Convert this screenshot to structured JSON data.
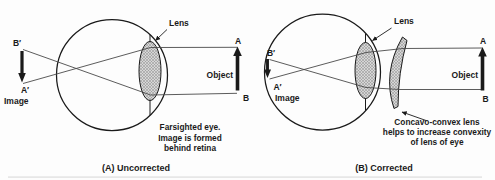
{
  "figure": {
    "title_semantic": "Farsighted eye correction diagram",
    "colors": {
      "ink": "#1a1a1a",
      "ray": "#4a4a4a",
      "lens_fill": "#d6d6d6",
      "lens_hatch": "#8e8e8e",
      "bg": "#fdfdfd",
      "artifact": "#dcdcdc"
    }
  },
  "panel_a": {
    "caption": "(A) Uncorrected",
    "lens_label": "Lens",
    "object_label": "Object",
    "image_label": "Image",
    "point_a": "A",
    "point_b": "B",
    "point_b_prime": "B′",
    "point_a_prime": "A′",
    "note_line1": "Farsighted eye.",
    "note_line2": "Image is formed",
    "note_line3": "behind retina"
  },
  "panel_b": {
    "caption": "(B) Corrected",
    "lens_label": "Lens",
    "object_label": "Object",
    "image_label": "Image",
    "point_a": "A",
    "point_b": "B",
    "point_b_prime": "B′",
    "point_a_prime": "A′",
    "note_line1": "Concavo-convex lens",
    "note_line2": "helps to increase convexity",
    "note_line3": "of lens of eye"
  }
}
